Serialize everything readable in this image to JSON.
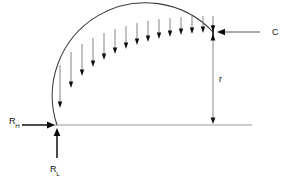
{
  "figure": {
    "background_color": "#ffffff",
    "curve_color": "#3a3a3a",
    "arrow_color": "#0d0d0d",
    "baseline_color": "#8e8e8e"
  },
  "labels": {
    "horizontal_reaction": "R",
    "horizontal_reaction_sub": "H",
    "vertical_reaction": "R",
    "vertical_reaction_sub": "L",
    "crown_thrust": "C",
    "radius": "r"
  },
  "chart_data": {
    "type": "line",
    "xlabel": "",
    "ylabel": "",
    "xlim": [
      0,
      288
    ],
    "ylim": [
      0,
      179
    ],
    "grid": false,
    "legend": "none",
    "arch": {
      "description": "quarter-circle arch curve",
      "springing_point": [
        57,
        125
      ],
      "crown_point": [
        213,
        32
      ],
      "radius_px": 93,
      "center": [
        213,
        125
      ]
    },
    "baseline": {
      "description": "horizontal ground reference line",
      "x_start": 50,
      "x_end": 252,
      "y": 125
    },
    "radius_dimension": {
      "label": "r",
      "x": 213,
      "y_top": 34,
      "y_bottom": 124,
      "label_position": [
        219,
        82
      ],
      "double_headed": true
    },
    "crown_thrust": {
      "label": "C",
      "direction": "left",
      "tail": [
        268,
        32
      ],
      "tip": [
        217,
        32
      ],
      "label_position": [
        272,
        35
      ]
    },
    "horizontal_reaction": {
      "label": "R_H",
      "direction": "right",
      "tail": [
        22,
        125
      ],
      "tip": [
        55,
        125
      ],
      "label_position": [
        9,
        124
      ]
    },
    "vertical_reaction": {
      "label": "R_L",
      "direction": "up",
      "tail": [
        57,
        158
      ],
      "tip": [
        57,
        128
      ],
      "label_position": [
        50,
        172
      ]
    },
    "distributed_load": {
      "description": "vertical downward arrows terminating on the arch, lengths decreasing toward the crown",
      "count": 15,
      "direction": "down",
      "arrows": [
        {
          "x": 60,
          "y_top": 65,
          "y_tip": 108
        },
        {
          "x": 71,
          "y_top": 52,
          "y_tip": 88
        },
        {
          "x": 82,
          "y_top": 44,
          "y_tip": 76
        },
        {
          "x": 93,
          "y_top": 38,
          "y_tip": 67
        },
        {
          "x": 104,
          "y_top": 33,
          "y_tip": 60
        },
        {
          "x": 115,
          "y_top": 29,
          "y_tip": 54
        },
        {
          "x": 126,
          "y_top": 26,
          "y_tip": 49
        },
        {
          "x": 137,
          "y_top": 23,
          "y_tip": 45
        },
        {
          "x": 148,
          "y_top": 21,
          "y_tip": 42
        },
        {
          "x": 159,
          "y_top": 19,
          "y_tip": 39
        },
        {
          "x": 170,
          "y_top": 18,
          "y_tip": 37
        },
        {
          "x": 181,
          "y_top": 17,
          "y_tip": 35
        },
        {
          "x": 192,
          "y_top": 16,
          "y_tip": 34
        },
        {
          "x": 203,
          "y_top": 16,
          "y_tip": 33
        },
        {
          "x": 213,
          "y_top": 16,
          "y_tip": 32
        }
      ]
    }
  }
}
